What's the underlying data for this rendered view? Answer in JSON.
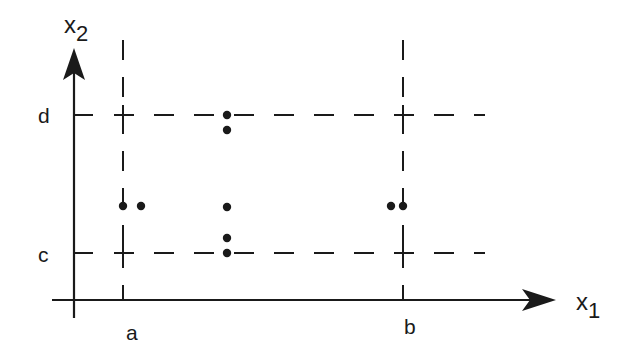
{
  "diagram": {
    "colors": {
      "ink": "#1a1a1a",
      "background": "#ffffff"
    },
    "axes": {
      "x": {
        "label_base": "x",
        "label_sub": "1"
      },
      "y": {
        "label_base": "x",
        "label_sub": "2"
      }
    },
    "tick_labels": {
      "a": "a",
      "b": "b",
      "c": "c",
      "d": "d"
    },
    "points": [
      {
        "x": 227,
        "y": 115
      },
      {
        "x": 227,
        "y": 130
      },
      {
        "x": 227,
        "y": 207
      },
      {
        "x": 227,
        "y": 238
      },
      {
        "x": 227,
        "y": 253
      },
      {
        "x": 123,
        "y": 206
      },
      {
        "x": 141,
        "y": 206
      },
      {
        "x": 391,
        "y": 206
      },
      {
        "x": 403,
        "y": 206
      }
    ]
  }
}
